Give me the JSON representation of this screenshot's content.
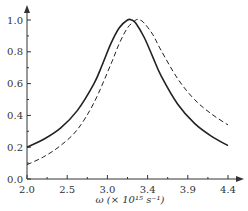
{
  "chart_data": {
    "type": "line",
    "title": "",
    "xlabel": "ω (× 10¹⁵ s⁻¹)",
    "ylabel": "",
    "xlim": [
      2.0,
      4.4
    ],
    "ylim": [
      0.0,
      1.05
    ],
    "x_ticks": [
      "2.0",
      "2.5",
      "3.0",
      "3.4",
      "3.9",
      "4.4"
    ],
    "y_ticks": [
      "0.0",
      "0.2",
      "0.4",
      "0.6",
      "0.8",
      "1.0"
    ],
    "grid": false,
    "legend": null,
    "series": [
      {
        "name": "solid",
        "style": "solid",
        "x": [
          2.0,
          2.2,
          2.4,
          2.6,
          2.8,
          2.9,
          3.0,
          3.1,
          3.2,
          3.25,
          3.3,
          3.4,
          3.5,
          3.6,
          3.8,
          4.0,
          4.2,
          4.4
        ],
        "y": [
          0.2,
          0.25,
          0.32,
          0.43,
          0.6,
          0.72,
          0.85,
          0.95,
          1.0,
          1.0,
          0.98,
          0.89,
          0.77,
          0.65,
          0.47,
          0.35,
          0.27,
          0.21
        ]
      },
      {
        "name": "dashed",
        "style": "dashed",
        "x": [
          2.0,
          2.2,
          2.4,
          2.6,
          2.8,
          3.0,
          3.1,
          3.2,
          3.3,
          3.35,
          3.4,
          3.5,
          3.6,
          3.8,
          4.0,
          4.2,
          4.4
        ],
        "y": [
          0.09,
          0.14,
          0.21,
          0.31,
          0.48,
          0.72,
          0.85,
          0.95,
          1.0,
          1.0,
          0.98,
          0.91,
          0.81,
          0.63,
          0.5,
          0.41,
          0.34
        ]
      }
    ]
  }
}
